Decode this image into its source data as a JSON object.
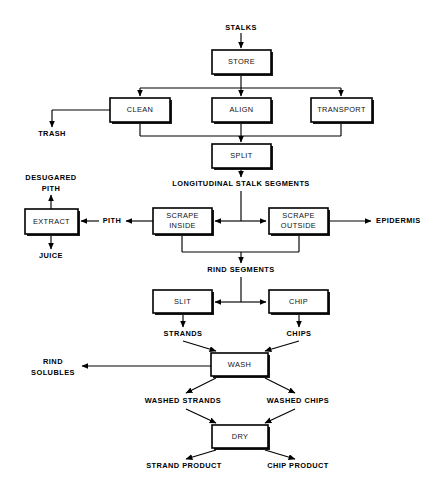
{
  "diagram": {
    "background_color": "#ffffff",
    "line_color": "#000000",
    "box_fill": "#ffffff",
    "process_boxes": [
      {
        "id": "store",
        "label": "STORE",
        "x": 212,
        "y": 50,
        "w": 59,
        "h": 24
      },
      {
        "id": "clean",
        "label": "CLEAN",
        "x": 110,
        "y": 98,
        "w": 60,
        "h": 24
      },
      {
        "id": "align",
        "label": "ALIGN",
        "x": 212,
        "y": 98,
        "w": 59,
        "h": 24
      },
      {
        "id": "transport",
        "label": "TRANSPORT",
        "x": 311,
        "y": 98,
        "w": 61,
        "h": 24
      },
      {
        "id": "split",
        "label": "SPLIT",
        "x": 212,
        "y": 144,
        "w": 59,
        "h": 24
      },
      {
        "id": "extract",
        "label": "EXTRACT",
        "x": 25,
        "y": 209,
        "w": 53,
        "h": 25
      },
      {
        "id": "scrape-inside",
        "label": "SCRAPE INSIDE",
        "x": 153,
        "y": 208,
        "w": 59,
        "h": 26
      },
      {
        "id": "scrape-outside",
        "label": "SCRAPE OUTSIDE",
        "x": 269,
        "y": 208,
        "w": 59,
        "h": 26
      },
      {
        "id": "slit",
        "label": "SLIT",
        "x": 153,
        "y": 290,
        "w": 59,
        "h": 23
      },
      {
        "id": "chip",
        "label": "CHIP",
        "x": 269,
        "y": 290,
        "w": 59,
        "h": 23
      },
      {
        "id": "wash",
        "label": "WASH",
        "x": 211,
        "y": 353,
        "w": 57,
        "h": 23
      },
      {
        "id": "dry",
        "label": "DRY",
        "x": 212,
        "y": 425,
        "w": 56,
        "h": 23
      }
    ],
    "material_labels": [
      {
        "id": "stalks",
        "text": "STALKS",
        "x": 241,
        "y": 28,
        "anchor": "middle"
      },
      {
        "id": "trash",
        "text": "TRASH",
        "x": 52,
        "y": 134,
        "anchor": "middle"
      },
      {
        "id": "longitudinal-stalk-segments",
        "text": "LONGITUDINAL STALK SEGMENTS",
        "x": 241,
        "y": 184,
        "anchor": "middle"
      },
      {
        "id": "desugared-pith-line1",
        "text": "DESUGARED",
        "x": 51,
        "y": 178,
        "anchor": "middle"
      },
      {
        "id": "desugared-pith-line2",
        "text": "PITH",
        "x": 51,
        "y": 189,
        "anchor": "middle"
      },
      {
        "id": "pith",
        "text": "PITH",
        "x": 112,
        "y": 221,
        "anchor": "middle"
      },
      {
        "id": "juice",
        "text": "JUICE",
        "x": 51,
        "y": 256,
        "anchor": "middle"
      },
      {
        "id": "epidermis",
        "text": "EPIDERMIS",
        "x": 376,
        "y": 221,
        "anchor": "start"
      },
      {
        "id": "rind-segments",
        "text": "RIND SEGMENTS",
        "x": 241,
        "y": 270,
        "anchor": "middle"
      },
      {
        "id": "strands",
        "text": "STRANDS",
        "x": 183,
        "y": 334,
        "anchor": "middle"
      },
      {
        "id": "chips",
        "text": "CHIPS",
        "x": 299,
        "y": 334,
        "anchor": "middle"
      },
      {
        "id": "rind-solubles-line1",
        "text": "RIND",
        "x": 53,
        "y": 362,
        "anchor": "middle"
      },
      {
        "id": "rind-solubles-line2",
        "text": "SOLUBLES",
        "x": 53,
        "y": 373,
        "anchor": "middle"
      },
      {
        "id": "washed-strands",
        "text": "WASHED STRANDS",
        "x": 183,
        "y": 401,
        "anchor": "middle"
      },
      {
        "id": "washed-chips",
        "text": "WASHED CHIPS",
        "x": 298,
        "y": 401,
        "anchor": "middle"
      },
      {
        "id": "strand-product",
        "text": "STRAND PRODUCT",
        "x": 184,
        "y": 466,
        "anchor": "middle"
      },
      {
        "id": "chip-product",
        "text": "CHIP PRODUCT",
        "x": 298,
        "y": 466,
        "anchor": "middle"
      }
    ],
    "flow_steps": [
      "STALKS",
      "STORE",
      "CLEAN",
      "ALIGN",
      "TRANSPORT",
      "TRASH",
      "SPLIT",
      "LONGITUDINAL STALK SEGMENTS",
      "SCRAPE INSIDE",
      "SCRAPE OUTSIDE",
      "EXTRACT",
      "DESUGARED PITH",
      "PITH",
      "JUICE",
      "EPIDERMIS",
      "RIND SEGMENTS",
      "SLIT",
      "CHIP",
      "STRANDS",
      "CHIPS",
      "WASH",
      "RIND SOLUBLES",
      "WASHED STRANDS",
      "WASHED CHIPS",
      "DRY",
      "STRAND PRODUCT",
      "CHIP PRODUCT"
    ]
  }
}
